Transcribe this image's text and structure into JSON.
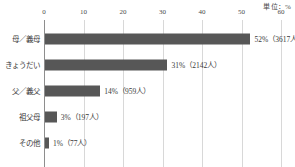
{
  "chart_data": {
    "type": "bar",
    "orientation": "horizontal",
    "title": "",
    "subtitle": "",
    "unit_caption": "単位：%",
    "xlabel": "",
    "ylabel": "",
    "xlim": [
      0,
      60
    ],
    "xticks": [
      "0",
      "10",
      "20",
      "30",
      "40",
      "50",
      "60"
    ],
    "xtick_values": [
      0,
      10,
      20,
      30,
      40,
      50,
      60
    ],
    "grid": "vertical",
    "legend": "none",
    "categories": [
      "母／義母",
      "きょうだい",
      "父／義父",
      "祖父母",
      "その他"
    ],
    "values": [
      52,
      31,
      14,
      3,
      1
    ],
    "counts": [
      3617,
      2142,
      959,
      197,
      77
    ],
    "data_labels": [
      "52%（3617人）",
      "31%（2142人）",
      "14%（959人）",
      "3%（197人）",
      "1%（77人）"
    ],
    "bars": [
      {
        "category": "母／義母",
        "value": 52,
        "count": 3617,
        "label": "52%（3617人）"
      },
      {
        "category": "きょうだい",
        "value": 31,
        "count": 2142,
        "label": "31%（2142人）"
      },
      {
        "category": "父／義父",
        "value": 14,
        "count": 959,
        "label": "14%（959人）"
      },
      {
        "category": "祖父母",
        "value": 3,
        "count": 197,
        "label": "3%（197人）"
      },
      {
        "category": "その他",
        "value": 1,
        "count": 77,
        "label": "1%（77人）"
      }
    ],
    "colors": {
      "bar": "#575757",
      "gridline": "#d8d8d8",
      "axis": "#8e8e8e",
      "text": "#3b3b3b",
      "background": "#ffffff"
    }
  }
}
